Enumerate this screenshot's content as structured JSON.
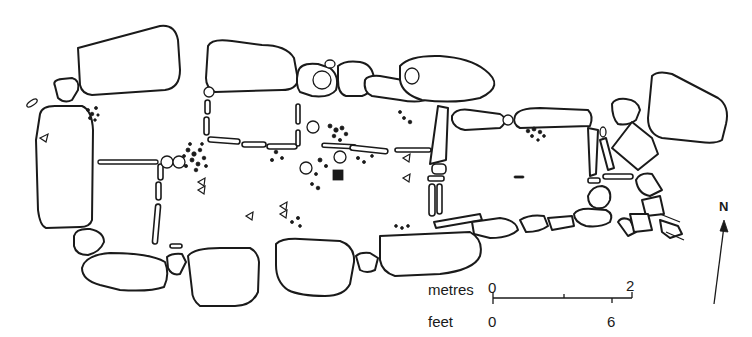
{
  "figure": {
    "type": "archaeological site plan"
  },
  "scale_bar": {
    "metres_label": "metres",
    "metres_ticks": [
      "0",
      "2"
    ],
    "feet_label": "feet",
    "feet_ticks": [
      "0",
      "6"
    ]
  },
  "north_arrow": {
    "label": "N"
  },
  "colors": {
    "ink": "#1a1a1a",
    "background": "#ffffff"
  }
}
